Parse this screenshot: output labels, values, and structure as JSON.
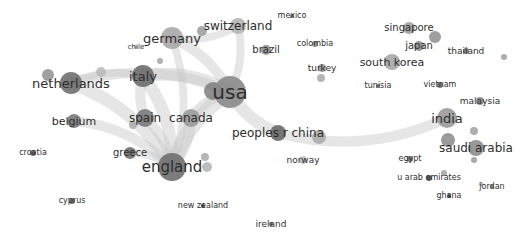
{
  "diagram": {
    "type": "network",
    "nodes": [
      {
        "id": "usa",
        "label": "usa",
        "weight": 10
      },
      {
        "id": "england",
        "label": "england",
        "weight": 8
      },
      {
        "id": "germany",
        "label": "germany",
        "weight": 6
      },
      {
        "id": "italy",
        "label": "italy",
        "weight": 6
      },
      {
        "id": "netherlands",
        "label": "netherlands",
        "weight": 6
      },
      {
        "id": "spain",
        "label": "spain",
        "weight": 5
      },
      {
        "id": "canada",
        "label": "canada",
        "weight": 5
      },
      {
        "id": "peoples_r_china",
        "label": "peoples r china",
        "weight": 5
      },
      {
        "id": "switzerland",
        "label": "switzerland",
        "weight": 4
      },
      {
        "id": "india",
        "label": "india",
        "weight": 5
      },
      {
        "id": "saudi_arabia",
        "label": "saudi arabia",
        "weight": 4
      },
      {
        "id": "south_korea",
        "label": "south korea",
        "weight": 4
      },
      {
        "id": "belgium",
        "label": "belgium",
        "weight": 4
      },
      {
        "id": "greece",
        "label": "greece",
        "weight": 3
      },
      {
        "id": "singapore",
        "label": "singapore",
        "weight": 3
      },
      {
        "id": "japan",
        "label": "japan",
        "weight": 3
      },
      {
        "id": "brazil",
        "label": "brazil",
        "weight": 2
      },
      {
        "id": "norway",
        "label": "norway",
        "weight": 2
      },
      {
        "id": "turkey",
        "label": "turkey",
        "weight": 2
      },
      {
        "id": "malaysia",
        "label": "malaysia",
        "weight": 2
      },
      {
        "id": "thailand",
        "label": "thailand",
        "weight": 1
      },
      {
        "id": "vietnam",
        "label": "vietnam",
        "weight": 1
      },
      {
        "id": "tunisia",
        "label": "tunisia",
        "weight": 1
      },
      {
        "id": "colombia",
        "label": "colombia",
        "weight": 1
      },
      {
        "id": "mexico",
        "label": "mexico",
        "weight": 1
      },
      {
        "id": "chile",
        "label": "chile",
        "weight": 1
      },
      {
        "id": "croatia",
        "label": "croatia",
        "weight": 1
      },
      {
        "id": "cyprus",
        "label": "cyprus",
        "weight": 1
      },
      {
        "id": "new_zealand",
        "label": "new zealand",
        "weight": 1
      },
      {
        "id": "ireland",
        "label": "ireland",
        "weight": 1
      },
      {
        "id": "egypt",
        "label": "egypt",
        "weight": 1
      },
      {
        "id": "u_arab_emirates",
        "label": "u arab emirates",
        "weight": 1
      },
      {
        "id": "ghana",
        "label": "ghana",
        "weight": 1
      },
      {
        "id": "jordan",
        "label": "jordan",
        "weight": 1
      }
    ],
    "links": [
      {
        "source": "usa",
        "target": "england",
        "strength": 5
      },
      {
        "source": "usa",
        "target": "italy",
        "strength": 4
      },
      {
        "source": "usa",
        "target": "germany",
        "strength": 3
      },
      {
        "source": "usa",
        "target": "netherlands",
        "strength": 3
      },
      {
        "source": "usa",
        "target": "peoples_r_china",
        "strength": 4
      },
      {
        "source": "usa",
        "target": "switzerland",
        "strength": 2
      },
      {
        "source": "usa",
        "target": "canada",
        "strength": 3
      },
      {
        "source": "england",
        "target": "italy",
        "strength": 4
      },
      {
        "source": "england",
        "target": "spain",
        "strength": 3
      },
      {
        "source": "england",
        "target": "netherlands",
        "strength": 4
      },
      {
        "source": "england",
        "target": "canada",
        "strength": 3
      },
      {
        "source": "england",
        "target": "greece",
        "strength": 2
      },
      {
        "source": "england",
        "target": "belgium",
        "strength": 3
      },
      {
        "source": "england",
        "target": "germany",
        "strength": 2
      },
      {
        "source": "italy",
        "target": "spain",
        "strength": 3
      },
      {
        "source": "italy",
        "target": "netherlands",
        "strength": 2
      },
      {
        "source": "peoples_r_china",
        "target": "india",
        "strength": 3
      },
      {
        "source": "germany",
        "target": "switzerland",
        "strength": 2
      }
    ]
  }
}
